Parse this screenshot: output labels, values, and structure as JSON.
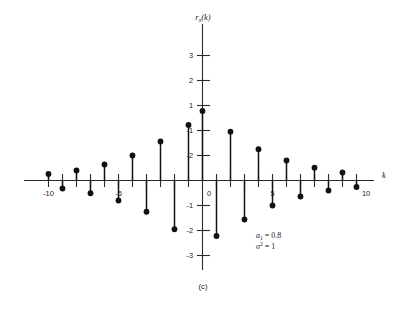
{
  "chart_data": {
    "type": "scatter",
    "plot_style": "stem",
    "title": "",
    "subtitle": "",
    "caption": "(c)",
    "xlabel": "k",
    "ylabel": "r_x(k)",
    "ylabel_base": "r",
    "ylabel_sub": "x",
    "ylabel_arg": "(k)",
    "x": [
      -11,
      -10,
      -9,
      -8,
      -7,
      -6,
      -5,
      -4,
      -3,
      -2,
      -1,
      0,
      1,
      2,
      3,
      4,
      5,
      6,
      7,
      8,
      9,
      10,
      11
    ],
    "values": [
      0.26,
      -0.32,
      0.4,
      -0.51,
      0.64,
      -0.8,
      1.0,
      -1.25,
      1.56,
      -1.95,
      2.22,
      2.78,
      -2.22,
      1.95,
      -1.56,
      1.25,
      -1.0,
      0.8,
      -0.64,
      0.51,
      -0.4,
      0.32,
      -0.26
    ],
    "xticks": [
      -10,
      -5,
      0,
      5,
      10
    ],
    "xtick_labels": [
      "-10",
      "-5",
      "0",
      "5",
      "10"
    ],
    "yticks": [
      -3,
      -2,
      -1,
      1,
      2,
      3,
      4,
      5
    ],
    "ytick_labels": [
      "-3",
      "-2",
      "-1",
      "1",
      "2",
      "3",
      "4",
      "5"
    ],
    "xlim": [
      -11.8,
      11.8
    ],
    "ylim": [
      -3.6,
      5.6
    ],
    "grid": false,
    "legend": false,
    "annotations": [
      {
        "text": "a_1 = 0.8",
        "symbol": "a",
        "sub": "1",
        "sup": "",
        "eq": "= 0.8"
      },
      {
        "text": "sigma^2 = 1",
        "symbol": "σ",
        "sub": "",
        "sup": "2",
        "eq": "= 1"
      }
    ]
  }
}
